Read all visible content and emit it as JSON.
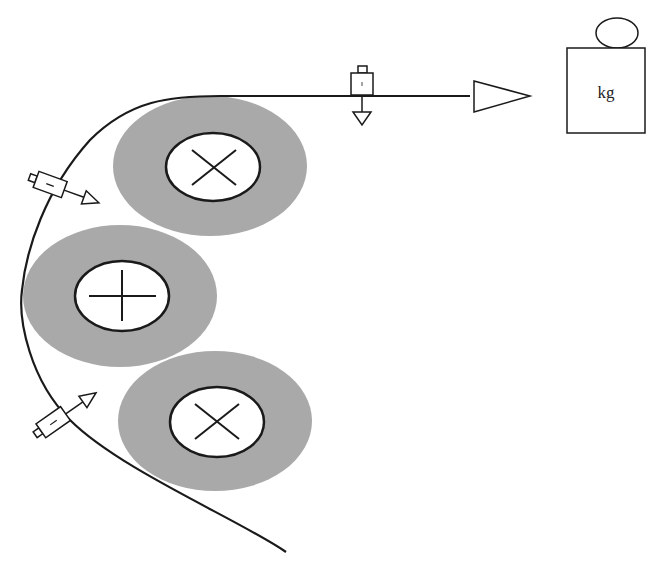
{
  "diagram": {
    "colors": {
      "roll_fill": "#a9a9a9",
      "core_fill": "#ffffff",
      "line": "#1a1a1a",
      "background": "#ffffff"
    },
    "rolls": [
      {
        "id": "top",
        "symbol": "cross-x"
      },
      {
        "id": "middle",
        "symbol": "plus"
      },
      {
        "id": "bottom",
        "symbol": "cross-x"
      }
    ],
    "sensors": [
      {
        "id": "top-horizontal-sensor",
        "direction": "down"
      },
      {
        "id": "left-upper-sensor",
        "direction": "right-down"
      },
      {
        "id": "left-lower-sensor",
        "direction": "right-up"
      }
    ],
    "weight": {
      "label": "kg"
    },
    "web_direction_arrow": "right"
  }
}
